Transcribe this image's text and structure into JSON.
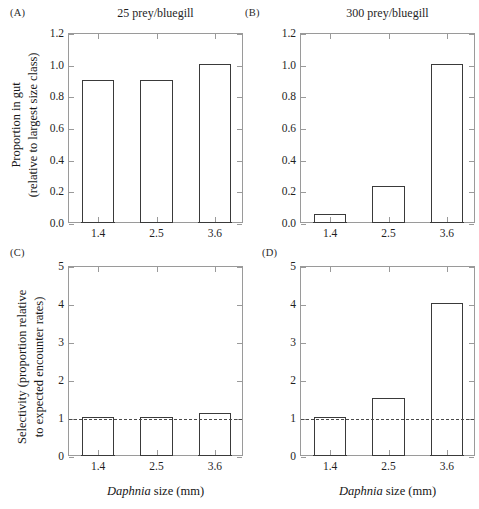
{
  "figure": {
    "x_axis_title_italic": "Daphnia",
    "x_axis_title_rest": " size (mm)"
  },
  "panels": {
    "a": {
      "label": "(A)",
      "title": "25 prey/bluegill",
      "ylabel_line1": "Proportion in gut",
      "ylabel_line2": "(relative to largest size class)"
    },
    "b": {
      "label": "(B)",
      "title": "300 prey/bluegill"
    },
    "c": {
      "label": "(C)",
      "ylabel_line1": "Selectivity (proportion relative",
      "ylabel_line2": "to expected encounter rates)"
    },
    "d": {
      "label": "(D)"
    }
  },
  "chart_data": [
    {
      "panel": "A",
      "type": "bar",
      "title": "25 prey/bluegill",
      "xlabel": "Daphnia size (mm)",
      "ylabel": "Proportion in gut (relative to largest size class)",
      "categories": [
        "1.4",
        "2.5",
        "3.6"
      ],
      "values": [
        0.9,
        0.9,
        1.0
      ],
      "ylim": [
        0.0,
        1.2
      ],
      "yticks": [
        "0.0",
        "0.2",
        "0.4",
        "0.6",
        "0.8",
        "1.0",
        "1.2"
      ],
      "ytick_values": [
        0.0,
        0.2,
        0.4,
        0.6,
        0.8,
        1.0,
        1.2
      ],
      "grid": false,
      "legend": "none",
      "bar_facecolor": "#ffffff",
      "bar_edgecolor": "#3a3a3a"
    },
    {
      "panel": "B",
      "type": "bar",
      "title": "300 prey/bluegill",
      "xlabel": "Daphnia size (mm)",
      "ylabel": "",
      "categories": [
        "1.4",
        "2.5",
        "3.6"
      ],
      "values": [
        0.05,
        0.23,
        1.0
      ],
      "ylim": [
        0.0,
        1.2
      ],
      "yticks": [
        "0.0",
        "0.2",
        "0.4",
        "0.6",
        "0.8",
        "1.0",
        "1.2"
      ],
      "ytick_values": [
        0.0,
        0.2,
        0.4,
        0.6,
        0.8,
        1.0,
        1.2
      ],
      "grid": false,
      "legend": "none",
      "bar_facecolor": "#ffffff",
      "bar_edgecolor": "#3a3a3a"
    },
    {
      "panel": "C",
      "type": "bar",
      "title": "",
      "xlabel": "Daphnia size (mm)",
      "ylabel": "Selectivity (proportion relative to expected encounter rates)",
      "categories": [
        "1.4",
        "2.5",
        "3.6"
      ],
      "values": [
        1.0,
        1.0,
        1.1
      ],
      "ylim": [
        0,
        5
      ],
      "yticks": [
        "0",
        "1",
        "2",
        "3",
        "4",
        "5"
      ],
      "ytick_values": [
        0,
        1,
        2,
        3,
        4,
        5
      ],
      "reference_line": 1,
      "reference_line_style": "dashed",
      "grid": false,
      "legend": "none",
      "bar_facecolor": "#ffffff",
      "bar_edgecolor": "#3a3a3a"
    },
    {
      "panel": "D",
      "type": "bar",
      "title": "",
      "xlabel": "Daphnia size (mm)",
      "ylabel": "",
      "categories": [
        "1.4",
        "2.5",
        "3.6"
      ],
      "values": [
        1.0,
        1.5,
        4.0
      ],
      "ylim": [
        0,
        5
      ],
      "yticks": [
        "0",
        "1",
        "2",
        "3",
        "4",
        "5"
      ],
      "ytick_values": [
        0,
        1,
        2,
        3,
        4,
        5
      ],
      "reference_line": 1,
      "reference_line_style": "dashed",
      "grid": false,
      "legend": "none",
      "bar_facecolor": "#ffffff",
      "bar_edgecolor": "#3a3a3a"
    }
  ]
}
